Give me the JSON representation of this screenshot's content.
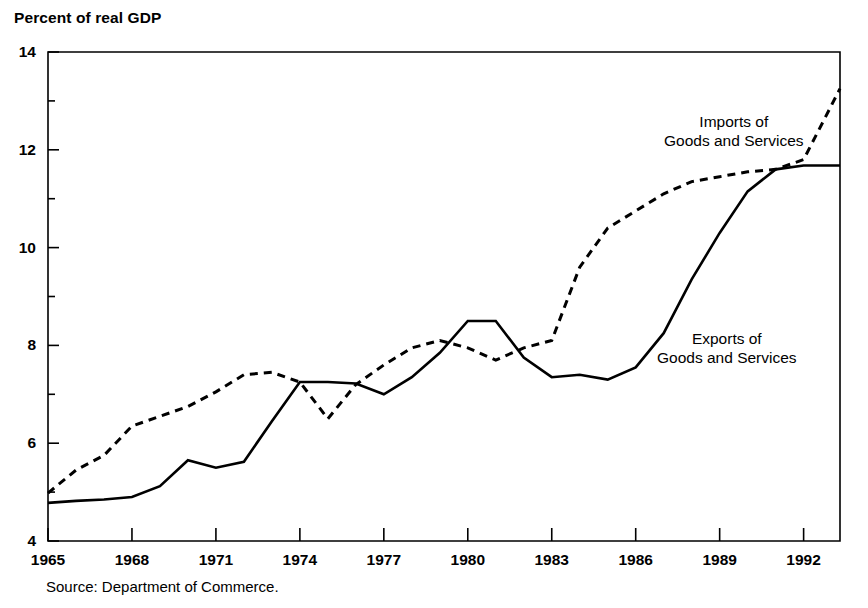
{
  "chart_data": {
    "type": "line",
    "title": "Percent of real GDP",
    "xlabel": "",
    "ylabel": "Percent of real GDP",
    "source": "Source: Department of Commerce.",
    "xlim": [
      1965,
      1993.3
    ],
    "ylim": [
      4,
      14
    ],
    "yticks": [
      4,
      6,
      8,
      10,
      12,
      14
    ],
    "ytick_labels": [
      "4",
      "6",
      "8",
      "10",
      "12",
      "14"
    ],
    "yminor_ticks": [
      5,
      7,
      9,
      11,
      13
    ],
    "xticks": [
      1965,
      1968,
      1971,
      1974,
      1977,
      1980,
      1983,
      1986,
      1989,
      1992
    ],
    "xtick_labels": [
      "1965",
      "1968",
      "1971",
      "1974",
      "1977",
      "1980",
      "1983",
      "1986",
      "1989",
      "1992"
    ],
    "grid": false,
    "legend_position": "inline-annotations",
    "x": [
      1965,
      1966,
      1967,
      1968,
      1969,
      1970,
      1971,
      1972,
      1973,
      1974,
      1975,
      1976,
      1977,
      1978,
      1979,
      1980,
      1981,
      1982,
      1983,
      1984,
      1985,
      1986,
      1987,
      1988,
      1989,
      1990,
      1991,
      1992,
      1993.3
    ],
    "series": [
      {
        "name": "Imports of Goods and Services",
        "style": "dashed",
        "color": "#000000",
        "values": [
          4.98,
          5.45,
          5.75,
          6.35,
          6.55,
          6.75,
          7.05,
          7.4,
          7.45,
          7.25,
          6.5,
          7.2,
          7.6,
          7.95,
          8.1,
          7.95,
          7.7,
          7.95,
          8.1,
          9.6,
          10.4,
          10.75,
          11.1,
          11.35,
          11.45,
          11.55,
          11.6,
          11.8,
          13.25
        ]
      },
      {
        "name": "Exports of Goods and Services",
        "style": "solid",
        "color": "#000000",
        "values": [
          4.78,
          4.82,
          4.85,
          4.9,
          5.12,
          5.65,
          5.5,
          5.62,
          6.45,
          7.25,
          7.25,
          7.22,
          7.0,
          7.35,
          7.85,
          8.5,
          8.5,
          7.75,
          7.35,
          7.4,
          7.3,
          7.55,
          8.25,
          9.35,
          10.3,
          11.15,
          11.6,
          11.68,
          11.68
        ]
      }
    ]
  },
  "annotations": {
    "imports_label_line1": "Imports of",
    "imports_label_line2": "Goods and Services",
    "exports_label_line1": "Exports of",
    "exports_label_line2": "Goods and Services"
  }
}
